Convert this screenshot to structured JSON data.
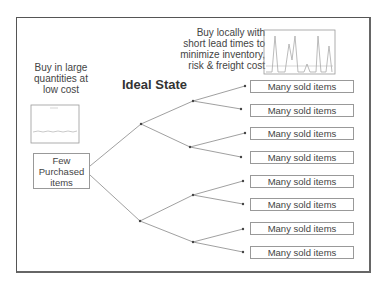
{
  "diagram": {
    "title": "Ideal State",
    "left_note": [
      "Buy in large",
      "quantities at",
      "low cost"
    ],
    "right_note": [
      "Buy locally with",
      "short lead times to",
      "minimize inventory,",
      "risk & freight cost"
    ],
    "root_node": [
      "Few",
      "Purchased",
      "items"
    ],
    "leaf_label": "Many sold items",
    "leaves": [
      "Many sold items",
      "Many sold items",
      "Many sold items",
      "Many sold items",
      "Many sold items",
      "Many sold items",
      "Many sold items",
      "Many sold items"
    ],
    "colors": {
      "line": "#888888",
      "border": "#555555",
      "chart_line": "#b0b0b0"
    }
  }
}
